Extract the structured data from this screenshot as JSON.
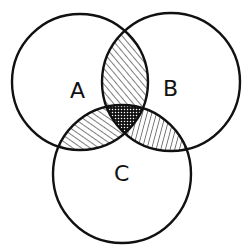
{
  "diagram": {
    "type": "venn",
    "sets": [
      {
        "id": "A",
        "label": "A",
        "cx": 80,
        "cy": 82,
        "r": 68
      },
      {
        "id": "B",
        "label": "B",
        "cx": 171,
        "cy": 82,
        "r": 69
      },
      {
        "id": "C",
        "label": "C",
        "cx": 122,
        "cy": 174,
        "r": 69
      }
    ],
    "regions": [
      {
        "name": "A∩B only",
        "fill": "diagonal-hatch"
      },
      {
        "name": "A∩C only",
        "fill": "diagonal-hatch"
      },
      {
        "name": "B∩C only",
        "fill": "vertical-hatch"
      },
      {
        "name": "A∩B∩C",
        "fill": "dotted-crosshatch"
      }
    ],
    "colors": {
      "stroke": "#111111",
      "background": "#ffffff"
    }
  }
}
